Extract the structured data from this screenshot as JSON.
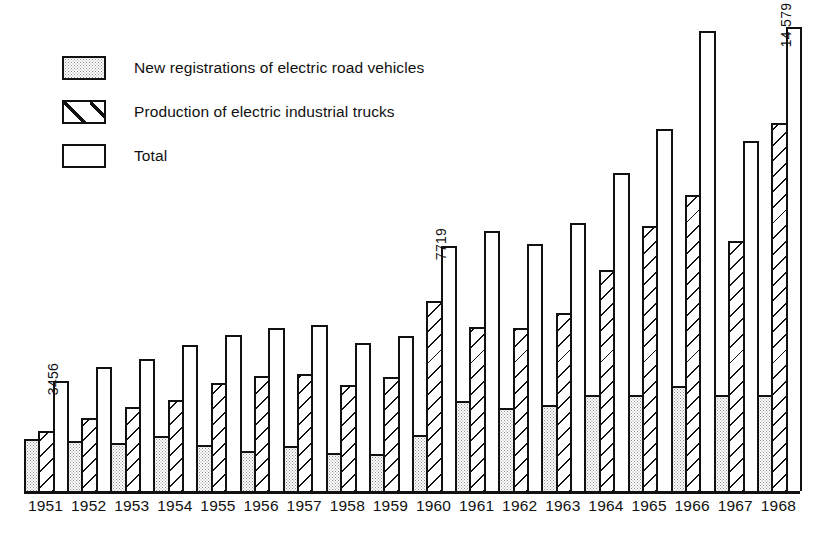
{
  "legend": {
    "items": [
      {
        "label": "New registrations of electric road vehicles",
        "pattern": "dotted",
        "icon": "legend-swatch-dotted"
      },
      {
        "label": "Production of electric industrial trucks",
        "pattern": "hatched",
        "icon": "legend-swatch-hatched"
      },
      {
        "label": "Total",
        "pattern": "empty",
        "icon": "legend-swatch-empty"
      }
    ]
  },
  "annotations": {
    "y1951_total": "3456",
    "y1960_total": "7719",
    "y1968_total": "14 579"
  },
  "chart_data": {
    "type": "bar",
    "title": "",
    "subtitle": "",
    "xlabel": "",
    "ylabel": "",
    "grid": false,
    "legend_position": "top-left",
    "axis_style": "baseline-only",
    "ylim": [
      0,
      15000
    ],
    "categories": [
      "1951",
      "1952",
      "1953",
      "1954",
      "1955",
      "1956",
      "1957",
      "1958",
      "1959",
      "1960",
      "1961",
      "1962",
      "1963",
      "1964",
      "1965",
      "1966",
      "1967",
      "1968"
    ],
    "series": [
      {
        "name": "New registrations of electric road vehicles",
        "pattern": "dotted",
        "values": [
          1640,
          1560,
          1500,
          1720,
          1450,
          1250,
          1420,
          1190,
          1160,
          1760,
          2830,
          2620,
          2720,
          3020,
          3020,
          3300,
          3020,
          3020
        ]
      },
      {
        "name": "Production of electric industrial trucks",
        "pattern": "hatched",
        "values": [
          1900,
          2290,
          2630,
          2870,
          3400,
          3620,
          3680,
          3330,
          3580,
          5960,
          5170,
          5120,
          5610,
          6960,
          8320,
          9310,
          7860,
          11560
        ]
      },
      {
        "name": "Total",
        "pattern": "empty",
        "values": [
          3456,
          3900,
          4140,
          4590,
          4920,
          5140,
          5230,
          4660,
          4860,
          7719,
          8170,
          7780,
          8440,
          10000,
          11380,
          14480,
          11000,
          14579
        ]
      }
    ],
    "data_labels": [
      {
        "category": "1951",
        "series": "Total",
        "text": "3456"
      },
      {
        "category": "1960",
        "series": "Total",
        "text": "7719"
      },
      {
        "category": "1968",
        "series": "Total",
        "text": "14 579"
      }
    ]
  }
}
